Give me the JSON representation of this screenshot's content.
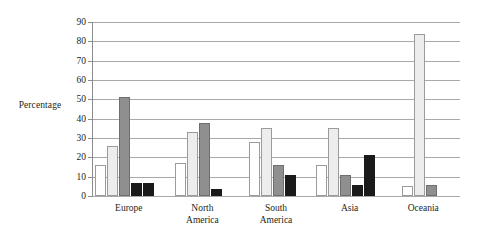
{
  "chart_data": {
    "type": "bar",
    "title": "",
    "subtitle": "",
    "xlabel": "",
    "ylabel": "Percentage",
    "ylim": [
      0,
      90
    ],
    "ytick_step": 10,
    "yticks": [
      0,
      10,
      20,
      30,
      40,
      50,
      60,
      70,
      80,
      90
    ],
    "grid": true,
    "legend": "none",
    "categories": [
      "Europe",
      "North America",
      "South America",
      "Asia",
      "Oceania"
    ],
    "category_labels_wrapped": [
      [
        "Europe"
      ],
      [
        "North",
        "America"
      ],
      [
        "South",
        "America"
      ],
      [
        "Asia"
      ],
      [
        "Oceania"
      ]
    ],
    "series": [
      {
        "name": "Series 1",
        "style": "white",
        "color": "#ffffff",
        "values": [
          16,
          17,
          28,
          16,
          5
        ]
      },
      {
        "name": "Series 2",
        "style": "light-gray",
        "color": "#ededed",
        "values": [
          26,
          33,
          35,
          35,
          84
        ]
      },
      {
        "name": "Series 3",
        "style": "dark-gray",
        "color": "#8f8f8f",
        "values": [
          51,
          38,
          16,
          11,
          5.5
        ]
      },
      {
        "name": "Series 4",
        "style": "black",
        "color": "#1a1a1a",
        "values": [
          7,
          3.5,
          11,
          5.5,
          0
        ]
      },
      {
        "name": "Series 5",
        "style": "black",
        "color": "#1a1a1a",
        "values": [
          6.5,
          0,
          0,
          21,
          0
        ]
      }
    ]
  },
  "axis": {
    "y_title": "Percentage",
    "y_tick_labels": [
      "90",
      "80",
      "70",
      "60",
      "50",
      "40",
      "30",
      "20",
      "10",
      "0"
    ]
  },
  "colors": {
    "background": "#ffffff",
    "gridline": "#a9a9a9",
    "axis": "#8c8c8c",
    "text": "#231f20",
    "series_white": "#ffffff",
    "series_light_gray": "#ededed",
    "series_dark_gray": "#8f8f8f",
    "series_black": "#1a1a1a"
  }
}
